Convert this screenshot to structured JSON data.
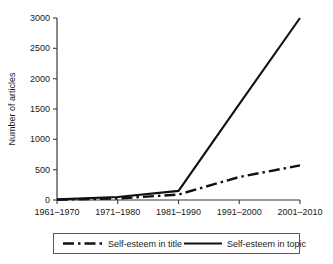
{
  "chart_data": {
    "type": "line",
    "title": "",
    "xlabel": "",
    "ylabel": "Number of articles",
    "categories": [
      "1961–1970",
      "1971–1980",
      "1981–1990",
      "1991–2000",
      "2001–2010"
    ],
    "ylim": [
      0,
      3000
    ],
    "yticks": [
      0,
      500,
      1000,
      1500,
      2000,
      2500,
      3000
    ],
    "ytick_labels": [
      "0",
      "500",
      "1000",
      "1500",
      "2000",
      "2500",
      "3000"
    ],
    "grid": false,
    "legend_position": "below-axes",
    "series": [
      {
        "name": "Self-esteem in title",
        "style": "dash-dot",
        "color": "#111111",
        "values": [
          5,
          25,
          90,
          380,
          570
        ]
      },
      {
        "name": "Self-esteem in topic",
        "style": "solid",
        "color": "#111111",
        "values": [
          10,
          50,
          150,
          1580,
          3000
        ]
      }
    ],
    "annotations": []
  },
  "axis": {
    "y_title": "Number of articles"
  },
  "legend": {
    "entries": [
      {
        "label": "Self-esteem in title",
        "style": "dash-dot"
      },
      {
        "label": "Self-esteem in topic",
        "style": "solid"
      }
    ]
  }
}
